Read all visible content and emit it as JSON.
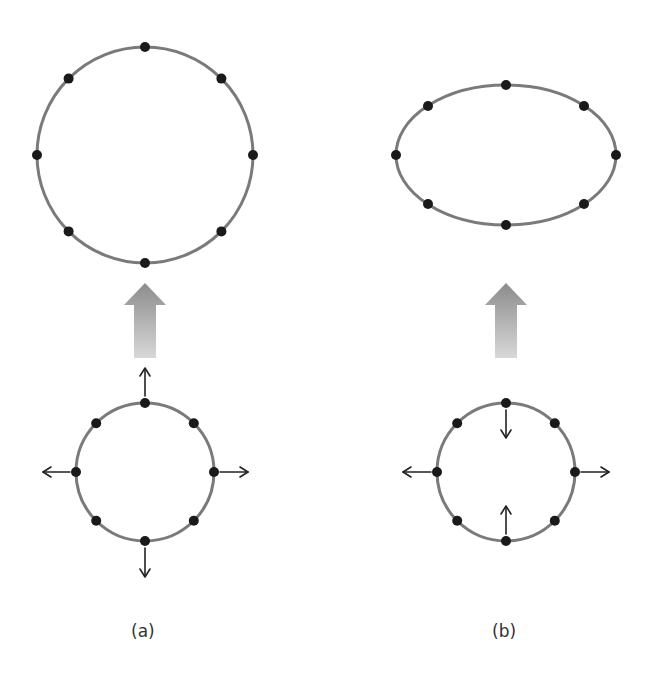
{
  "figure": {
    "panels": [
      {
        "id": "a",
        "label": "(a)",
        "description": "Circle of particles stretched equally in all directions becomes a larger circle",
        "initial_shape": {
          "type": "circle",
          "cx": 145,
          "cy": 472,
          "r": 69,
          "points": 8
        },
        "final_shape": {
          "type": "circle",
          "cx": 145,
          "cy": 155,
          "r": 108,
          "points": 8
        },
        "force_arrows": [
          "up-outward",
          "down-outward",
          "left-outward",
          "right-outward"
        ],
        "transition_arrow": "up"
      },
      {
        "id": "b",
        "label": "(b)",
        "description": "Circle of particles stretched horizontally and squeezed vertically becomes an ellipse",
        "initial_shape": {
          "type": "circle",
          "cx": 506,
          "cy": 472,
          "r": 69,
          "points": 8
        },
        "final_shape": {
          "type": "ellipse",
          "cx": 506,
          "cy": 155,
          "rx": 110,
          "ry": 70,
          "points": 8
        },
        "force_arrows": [
          "top-inward",
          "bottom-inward",
          "left-outward",
          "right-outward"
        ],
        "transition_arrow": "up"
      }
    ],
    "colors": {
      "ring": "#7a7a7a",
      "dot": "#1a1a1a",
      "arrow_top": "#8c8c8c",
      "arrow_bottom": "#d8d8d8"
    }
  }
}
